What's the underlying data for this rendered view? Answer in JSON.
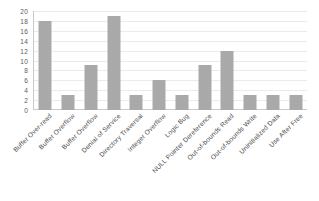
{
  "chart_data": {
    "type": "bar",
    "title": "",
    "subtitle": "",
    "xlabel": "",
    "ylabel": "",
    "ylim": [
      0,
      20
    ],
    "ytick_step": 2,
    "yticks": [
      0,
      2,
      4,
      6,
      8,
      10,
      12,
      14,
      16,
      18,
      20
    ],
    "ytick_labels": [
      "0",
      "2",
      "4",
      "6",
      "8",
      "10",
      "12",
      "14",
      "16",
      "18",
      "20"
    ],
    "grid": true,
    "grid_axis": "y",
    "legend": false,
    "legend_position": "none",
    "annotations": [],
    "categories": [
      "Buffer Over-read",
      "Buffer Overflow",
      "Buffer Overflow",
      "Denial of Service",
      "Directory Traversal",
      "Integer Overflow",
      "Logic Bug",
      "NULL Pointer Dereference",
      "Out-of-bounds Read",
      "Out-of-bounds Write",
      "Uninitialized Data",
      "Use After Free"
    ],
    "values": [
      18,
      3,
      9,
      19,
      3,
      6,
      3,
      9,
      12,
      3,
      3,
      3
    ],
    "bar_color": "#a9a9a9",
    "axis_color": "#c9c9c9",
    "gridline_color": "#ebebeb",
    "background_color": "#ffffff",
    "tick_label_rotation": -45
  }
}
